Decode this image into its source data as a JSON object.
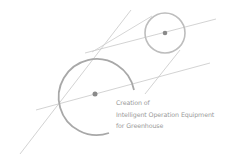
{
  "caption": {
    "lines": [
      "Creation of",
      "Intelligent Operation Equipment",
      "for Greenhouse"
    ]
  },
  "colors": {
    "line": "#c4c4c4",
    "circle": "#a8a8a8",
    "dot": "#8a8a8a",
    "text": "#9a9a9a"
  },
  "icon": "geometric-circles-logo"
}
